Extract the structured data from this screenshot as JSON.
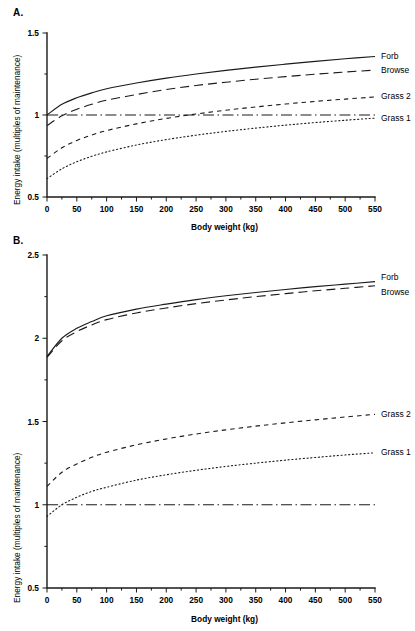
{
  "figure": {
    "panels": [
      {
        "id": "A",
        "label": "A.",
        "xlabel": "Body weight (kg)",
        "ylabel": "Energy intake (multiples of maintenance)",
        "xticks": [
          "0",
          "50",
          "100",
          "150",
          "200",
          "250",
          "300",
          "350",
          "400",
          "450",
          "500",
          "550"
        ],
        "yticks": [
          "0.5",
          "1",
          "1.5"
        ]
      },
      {
        "id": "B",
        "label": "B.",
        "xlabel": "Body weight (kg)",
        "ylabel": "Energy intake (multiples of maintenance)",
        "xticks": [
          "0",
          "50",
          "100",
          "150",
          "200",
          "250",
          "300",
          "350",
          "400",
          "450",
          "500",
          "550"
        ],
        "yticks": [
          "0.5",
          "1",
          "1.5",
          "2",
          "2.5"
        ]
      }
    ],
    "series_labels": {
      "forb": "Forb",
      "browse": "Browse",
      "grass2": "Grass 2",
      "grass1": "Grass 1"
    }
  },
  "chart_data": [
    {
      "type": "line",
      "panel": "A",
      "title": "",
      "xlabel": "Body weight (kg)",
      "ylabel": "Energy intake (multiples of maintenance)",
      "xlim": [
        0,
        550
      ],
      "ylim": [
        0.5,
        1.5
      ],
      "xticks": [
        0,
        50,
        100,
        150,
        200,
        250,
        300,
        350,
        400,
        450,
        500,
        550
      ],
      "yticks": [
        0.5,
        1,
        1.5
      ],
      "minor_tick_interval_x": 25,
      "minor_tick_interval_y": 0.25,
      "grid": false,
      "legend": "right-inline",
      "x": [
        0,
        25,
        50,
        75,
        100,
        150,
        200,
        250,
        300,
        350,
        400,
        450,
        500,
        550
      ],
      "series": [
        {
          "name": "Forb",
          "style": "solid",
          "values": [
            1.0,
            1.065,
            1.105,
            1.135,
            1.16,
            1.195,
            1.225,
            1.25,
            1.272,
            1.292,
            1.31,
            1.327,
            1.343,
            1.357
          ]
        },
        {
          "name": "Browse",
          "style": "long-dash",
          "values": [
            0.935,
            0.995,
            1.035,
            1.065,
            1.09,
            1.125,
            1.155,
            1.18,
            1.2,
            1.218,
            1.234,
            1.249,
            1.262,
            1.274
          ]
        },
        {
          "name": "Grass 2",
          "style": "short-dash",
          "values": [
            0.735,
            0.8,
            0.845,
            0.878,
            0.905,
            0.946,
            0.979,
            1.006,
            1.029,
            1.049,
            1.067,
            1.083,
            1.097,
            1.11
          ]
        },
        {
          "name": "Grass 1",
          "style": "dotted",
          "values": [
            0.612,
            0.672,
            0.715,
            0.748,
            0.775,
            0.817,
            0.85,
            0.877,
            0.9,
            0.92,
            0.938,
            0.954,
            0.968,
            0.981
          ]
        },
        {
          "name": "Maintenance",
          "style": "dash-dot",
          "values": [
            1.0,
            1.0,
            1.0,
            1.0,
            1.0,
            1.0,
            1.0,
            1.0,
            1.0,
            1.0,
            1.0,
            1.0,
            1.0,
            1.0
          ]
        }
      ]
    },
    {
      "type": "line",
      "panel": "B",
      "title": "",
      "xlabel": "Body weight (kg)",
      "ylabel": "Energy intake (multiples of maintenance)",
      "xlim": [
        0,
        550
      ],
      "ylim": [
        0.5,
        2.5
      ],
      "xticks": [
        0,
        50,
        100,
        150,
        200,
        250,
        300,
        350,
        400,
        450,
        500,
        550
      ],
      "yticks": [
        0.5,
        1,
        1.5,
        2,
        2.5
      ],
      "minor_tick_interval_x": 25,
      "minor_tick_interval_y": 0.25,
      "grid": false,
      "legend": "right-inline",
      "x": [
        0,
        25,
        50,
        75,
        100,
        150,
        200,
        250,
        300,
        350,
        400,
        450,
        500,
        550
      ],
      "series": [
        {
          "name": "Forb",
          "style": "solid",
          "values": [
            1.89,
            2.0,
            2.06,
            2.1,
            2.135,
            2.175,
            2.205,
            2.232,
            2.255,
            2.275,
            2.293,
            2.31,
            2.325,
            2.34
          ]
        },
        {
          "name": "Browse",
          "style": "long-dash",
          "values": [
            1.885,
            1.985,
            2.04,
            2.08,
            2.112,
            2.152,
            2.182,
            2.208,
            2.23,
            2.25,
            2.268,
            2.285,
            2.3,
            2.315
          ]
        },
        {
          "name": "Grass 2",
          "style": "short-dash",
          "values": [
            1.11,
            1.195,
            1.245,
            1.285,
            1.315,
            1.36,
            1.395,
            1.425,
            1.45,
            1.472,
            1.492,
            1.51,
            1.527,
            1.543
          ]
        },
        {
          "name": "Grass 1",
          "style": "dotted",
          "values": [
            0.93,
            1.0,
            1.045,
            1.08,
            1.105,
            1.148,
            1.18,
            1.207,
            1.23,
            1.25,
            1.268,
            1.284,
            1.299,
            1.312
          ]
        },
        {
          "name": "Maintenance",
          "style": "dash-dot",
          "values": [
            1.0,
            1.0,
            1.0,
            1.0,
            1.0,
            1.0,
            1.0,
            1.0,
            1.0,
            1.0,
            1.0,
            1.0,
            1.0,
            1.0
          ]
        }
      ]
    }
  ]
}
